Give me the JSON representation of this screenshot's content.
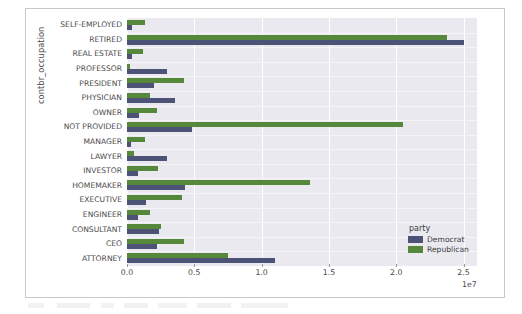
{
  "chart_data": {
    "type": "bar",
    "orientation": "horizontal",
    "title": "",
    "xlabel": "",
    "ylabel": "contbr_occupation",
    "x_offset_text": "1e7",
    "xlim": [
      0,
      26000000
    ],
    "xticks": [
      0,
      5000000,
      10000000,
      15000000,
      20000000,
      25000000
    ],
    "xtick_labels": [
      "0.0",
      "0.5",
      "1.0",
      "1.5",
      "2.0",
      "2.5"
    ],
    "grid": true,
    "legend": {
      "title": "party",
      "position": "lower right",
      "entries": [
        {
          "name": "Democrat",
          "color": "#4c5377"
        },
        {
          "name": "Republican",
          "color": "#55883b"
        }
      ]
    },
    "categories": [
      "SELF-EMPLOYED",
      "RETIRED",
      "REAL ESTATE",
      "PROFESSOR",
      "PRESIDENT",
      "PHYSICIAN",
      "OWNER",
      "NOT PROVIDED",
      "MANAGER",
      "LAWYER",
      "INVESTOR",
      "HOMEMAKER",
      "EXECUTIVE",
      "ENGINEER",
      "CONSULTANT",
      "CEO",
      "ATTORNEY"
    ],
    "series": [
      {
        "name": "Democrat",
        "color": "#4c5377",
        "values": [
          400000,
          25000000,
          350000,
          3000000,
          2000000,
          3600000,
          900000,
          4800000,
          300000,
          3000000,
          800000,
          4300000,
          1400000,
          800000,
          2400000,
          2200000,
          11000000
        ]
      },
      {
        "name": "Republican",
        "color": "#55883b",
        "values": [
          1300000,
          23800000,
          1200000,
          200000,
          4200000,
          1700000,
          2200000,
          20500000,
          1300000,
          500000,
          2300000,
          13600000,
          4100000,
          1700000,
          2500000,
          4200000,
          7500000
        ]
      }
    ]
  },
  "figure": {
    "background_color": "#ffffff",
    "plot_background_color": "#e9e9ef",
    "gridline_color": "#ffffff",
    "tick_text_color": "#4b4b4b"
  }
}
